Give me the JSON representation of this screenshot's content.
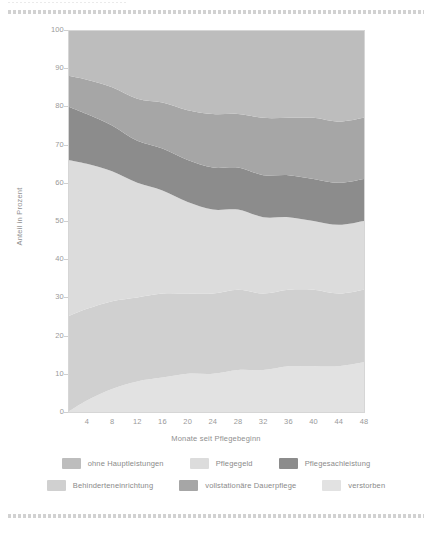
{
  "decor": {
    "top_rule": "dashed-rule",
    "bottom_rule": "dashed-rule"
  },
  "chart_data": {
    "type": "area",
    "title": "",
    "subtitle": "",
    "xlabel": "Monate seit Pflegebeginn",
    "ylabel": "Anteil in Prozent",
    "xlim": [
      1,
      48
    ],
    "ylim": [
      0,
      100
    ],
    "grid": false,
    "stacked": true,
    "normalized": true,
    "legend_position": "bottom",
    "xticks": [
      4,
      8,
      12,
      16,
      20,
      24,
      28,
      32,
      36,
      40,
      44,
      48
    ],
    "yticks": [
      0,
      10,
      20,
      30,
      40,
      50,
      60,
      70,
      80,
      90,
      100
    ],
    "x": [
      1,
      4,
      8,
      12,
      16,
      20,
      24,
      28,
      32,
      36,
      40,
      44,
      48
    ],
    "series": [
      {
        "name": "verstorben",
        "color": "#e2e2e2",
        "order": 1,
        "values": [
          0,
          3,
          6,
          8,
          9,
          10,
          10,
          11,
          11,
          12,
          12,
          12,
          13
        ]
      },
      {
        "name": "Behinderteneinrichtung",
        "color": "#d0d0d0",
        "order": 2,
        "values": [
          25,
          24,
          23,
          22,
          22,
          21,
          21,
          21,
          20,
          20,
          20,
          19,
          19
        ]
      },
      {
        "name": "Pflegegeld",
        "color": "#dcdcdc",
        "order": 3,
        "values": [
          41,
          38,
          34,
          30,
          27,
          24,
          22,
          21,
          20,
          19,
          18,
          18,
          18
        ]
      },
      {
        "name": "Pflegesachleistung",
        "color": "#8c8c8c",
        "order": 4,
        "values": [
          14,
          13,
          12,
          11,
          11,
          11,
          11,
          11,
          11,
          11,
          11,
          11,
          11
        ]
      },
      {
        "name": "vollstationäre Dauerpflege",
        "color": "#a6a6a6",
        "order": 5,
        "values": [
          8,
          9,
          10,
          11,
          12,
          13,
          14,
          14,
          15,
          15,
          16,
          16,
          16
        ]
      },
      {
        "name": "ohne Hauptleistungen",
        "color": "#bdbdbd",
        "order": 6,
        "values": [
          12,
          13,
          15,
          18,
          19,
          21,
          22,
          22,
          23,
          23,
          23,
          24,
          23
        ]
      }
    ],
    "boundaries_note": "cumulative stacked to 100%",
    "legend_entries": [
      {
        "label": "ohne Hauptleistungen",
        "color": "#bdbdbd"
      },
      {
        "label": "Pflegegeld",
        "color": "#dcdcdc"
      },
      {
        "label": "Pflegesachleistung",
        "color": "#8c8c8c"
      },
      {
        "label": "Behinderteneinrichtung",
        "color": "#d0d0d0"
      },
      {
        "label": "vollstationäre Dauerpflege",
        "color": "#a6a6a6"
      },
      {
        "label": "verstorben",
        "color": "#e2e2e2"
      }
    ]
  },
  "axis": {
    "yticks": [
      "100",
      "90",
      "80",
      "70",
      "60",
      "50",
      "40",
      "30",
      "20",
      "10",
      "0"
    ],
    "xticks": [
      "4",
      "8",
      "12",
      "16",
      "20",
      "24",
      "28",
      "32",
      "36",
      "40",
      "44",
      "48"
    ],
    "ylabel": "Anteil in Prozent",
    "xlabel": "Monate seit Pflegebeginn"
  }
}
